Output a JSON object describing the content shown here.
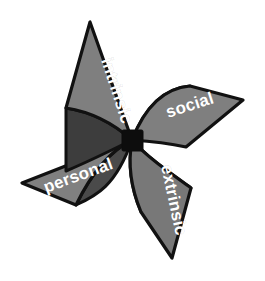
{
  "figure": {
    "name": "pinwheel-diagram",
    "background_color": "#ffffff",
    "outline_color": "#111111",
    "hub_color": "#0d0d0d",
    "label_color": "#ffffff",
    "width": 265,
    "height": 281
  },
  "center": {
    "x": 132,
    "y": 140
  },
  "blades": [
    {
      "id": "intrinsic",
      "label": "intrinsic",
      "position": "top-left",
      "face_color": "#7f7f7f",
      "fold_color": "#3d3d3d",
      "tip": {
        "x": 90,
        "y": 22
      },
      "label_x": 101,
      "label_y": 60,
      "label_rotation": 72
    },
    {
      "id": "social",
      "label": "social",
      "position": "top-right",
      "face_color": "#7f7f7f",
      "fold_color": "#595959",
      "tip": {
        "x": 243,
        "y": 100
      },
      "label_x": 168,
      "label_y": 118,
      "label_rotation": -18
    },
    {
      "id": "personal",
      "label": "personal",
      "position": "bottom-left",
      "face_color": "#808080",
      "fold_color": "#4a4a4a",
      "tip": {
        "x": 22,
        "y": 183
      },
      "label_x": 46,
      "label_y": 193,
      "label_rotation": -20
    },
    {
      "id": "extrinsic",
      "label": "extrinsic",
      "position": "bottom-right",
      "face_color": "#787878",
      "fold_color": "#9b9b9b",
      "tip": {
        "x": 172,
        "y": 258
      },
      "label_x": 161,
      "label_y": 166,
      "label_rotation": 78
    }
  ],
  "legend": {
    "axis_note": "",
    "caption": ""
  }
}
